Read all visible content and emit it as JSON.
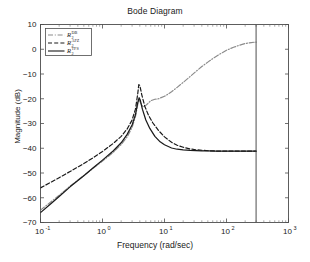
{
  "chart_data": {
    "type": "line",
    "title": "Bode Diagram",
    "xlabel": "Frequency  (rad/sec)",
    "ylabel": "Magnitude (dB)",
    "xscale": "log",
    "xlim": [
      0.1,
      1000
    ],
    "ylim": [
      -70,
      10
    ],
    "yticks": [
      10,
      0,
      -10,
      -20,
      -30,
      -40,
      -50,
      -60,
      -70
    ],
    "ytick_labels": [
      "10",
      "0",
      "−10",
      "−20",
      "−30",
      "−40",
      "−50",
      "−60",
      "−70"
    ],
    "xticks": [
      0.1,
      1,
      10,
      100,
      1000
    ],
    "xtick_labels": [
      "10-1",
      "100",
      "101",
      "102",
      "103"
    ],
    "xtick_mantissa": "10",
    "xtick_exponents": [
      "-1",
      "0",
      "1",
      "2",
      "3"
    ],
    "grid": false,
    "legend_position": "upper left",
    "annotations": [
      {
        "name": "cutoff-line",
        "type": "vertical-line",
        "x": 300,
        "label": ""
      }
    ],
    "series": [
      {
        "name": "R_2^{DB}",
        "base": "R",
        "subscript": "2",
        "superscript": "DB",
        "style": "dash-dot",
        "color": "#8c8c8c",
        "points": [
          [
            0.1,
            -65.0
          ],
          [
            0.15,
            -61.5
          ],
          [
            0.2,
            -59.0
          ],
          [
            0.3,
            -55.3
          ],
          [
            0.5,
            -51.0
          ],
          [
            0.7,
            -48.2
          ],
          [
            1.0,
            -45.2
          ],
          [
            1.5,
            -41.6
          ],
          [
            2.0,
            -38.5
          ],
          [
            2.5,
            -35.4
          ],
          [
            3.0,
            -31.6
          ],
          [
            3.4,
            -27.2
          ],
          [
            3.7,
            -22.4
          ],
          [
            3.9,
            -20.2
          ],
          [
            4.1,
            -21.6
          ],
          [
            4.5,
            -23.3
          ],
          [
            5.0,
            -22.7
          ],
          [
            6.0,
            -20.8
          ],
          [
            7.0,
            -20.2
          ],
          [
            8.0,
            -20.0
          ],
          [
            10.0,
            -19.0
          ],
          [
            13.0,
            -17.2
          ],
          [
            16.0,
            -15.4
          ],
          [
            20.0,
            -13.4
          ],
          [
            26.0,
            -11.0
          ],
          [
            32.0,
            -9.0
          ],
          [
            40.0,
            -7.0
          ],
          [
            50.0,
            -5.2
          ],
          [
            65.0,
            -3.2
          ],
          [
            80.0,
            -1.8
          ],
          [
            100.0,
            -0.4
          ],
          [
            130.0,
            0.8
          ],
          [
            160.0,
            1.6
          ],
          [
            200.0,
            2.3
          ],
          [
            250.0,
            2.7
          ],
          [
            300.0,
            2.9
          ]
        ]
      },
      {
        "name": "R_2^{AFZ}",
        "base": "R",
        "subscript": "2",
        "superscript": "AFZ",
        "style": "dashed",
        "color": "#1a1a1a",
        "points": [
          [
            0.1,
            -56.0
          ],
          [
            0.15,
            -53.6
          ],
          [
            0.2,
            -51.9
          ],
          [
            0.3,
            -49.4
          ],
          [
            0.5,
            -46.2
          ],
          [
            0.7,
            -43.9
          ],
          [
            1.0,
            -41.3
          ],
          [
            1.5,
            -38.0
          ],
          [
            2.0,
            -35.2
          ],
          [
            2.5,
            -32.2
          ],
          [
            3.0,
            -28.6
          ],
          [
            3.4,
            -24.2
          ],
          [
            3.7,
            -18.0
          ],
          [
            3.85,
            -14.3
          ],
          [
            4.0,
            -14.6
          ],
          [
            4.3,
            -18.4
          ],
          [
            4.8,
            -23.0
          ],
          [
            5.5,
            -26.6
          ],
          [
            6.5,
            -29.8
          ],
          [
            8.0,
            -32.8
          ],
          [
            10.0,
            -35.4
          ],
          [
            13.0,
            -37.6
          ],
          [
            16.0,
            -38.8
          ],
          [
            20.0,
            -39.6
          ],
          [
            26.0,
            -40.3
          ],
          [
            32.0,
            -40.6
          ],
          [
            40.0,
            -40.8
          ],
          [
            50.0,
            -41.0
          ],
          [
            65.0,
            -41.1
          ],
          [
            80.0,
            -41.2
          ],
          [
            100.0,
            -41.2
          ],
          [
            150.0,
            -41.2
          ],
          [
            200.0,
            -41.2
          ],
          [
            250.0,
            -41.2
          ],
          [
            300.0,
            -41.2
          ]
        ]
      },
      {
        "name": "R_2^{TFS}",
        "base": "R",
        "subscript": "2",
        "superscript": "TFS",
        "style": "solid",
        "color": "#1a1a1a",
        "points": [
          [
            0.1,
            -66.0
          ],
          [
            0.15,
            -62.2
          ],
          [
            0.2,
            -59.5
          ],
          [
            0.3,
            -55.6
          ],
          [
            0.5,
            -51.1
          ],
          [
            0.7,
            -48.0
          ],
          [
            1.0,
            -44.8
          ],
          [
            1.5,
            -41.0
          ],
          [
            2.0,
            -37.8
          ],
          [
            2.5,
            -34.4
          ],
          [
            3.0,
            -30.6
          ],
          [
            3.4,
            -26.4
          ],
          [
            3.7,
            -21.6
          ],
          [
            3.9,
            -19.6
          ],
          [
            4.05,
            -20.4
          ],
          [
            4.4,
            -24.2
          ],
          [
            5.0,
            -28.6
          ],
          [
            5.8,
            -32.0
          ],
          [
            7.0,
            -35.2
          ],
          [
            8.5,
            -37.4
          ],
          [
            10.0,
            -38.6
          ],
          [
            13.0,
            -39.9
          ],
          [
            16.0,
            -40.4
          ],
          [
            20.0,
            -40.7
          ],
          [
            26.0,
            -40.9
          ],
          [
            32.0,
            -41.0
          ],
          [
            40.0,
            -41.1
          ],
          [
            50.0,
            -41.1
          ],
          [
            65.0,
            -41.2
          ],
          [
            80.0,
            -41.2
          ],
          [
            100.0,
            -41.2
          ],
          [
            150.0,
            -41.2
          ],
          [
            200.0,
            -41.2
          ],
          [
            250.0,
            -41.2
          ],
          [
            300.0,
            -41.2
          ]
        ]
      }
    ]
  },
  "figure": {
    "title": "Bode Diagram",
    "xlabel": "Frequency  (rad/sec)",
    "ylabel": "Magnitude (dB)"
  }
}
